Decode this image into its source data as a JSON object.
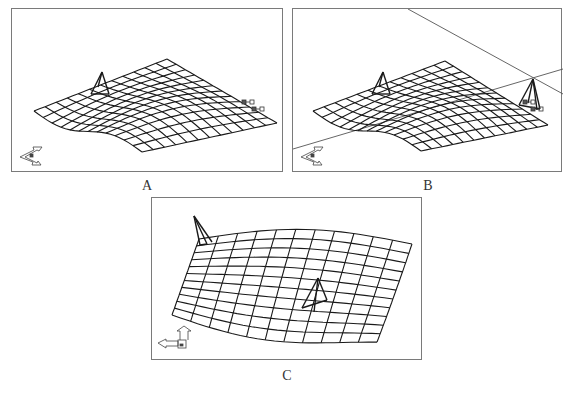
{
  "figure": {
    "panels": [
      {
        "id": "A",
        "caption": "A",
        "description": "Wireframe deformable surface mesh with single pyramid control handle and small selected node markers at right edge"
      },
      {
        "id": "B",
        "caption": "B",
        "description": "Same mesh with construction lines intersecting at a second pyramid handle above right-edge nodes"
      },
      {
        "id": "C",
        "caption": "C",
        "description": "Mesh viewed from another angle, showing pyramid handles at top-left edge and center"
      }
    ],
    "colors": {
      "mesh": "#1a1a1a",
      "frame": "#7a7a7a",
      "construction_line": "#555555",
      "background": "#ffffff"
    },
    "icons": [
      "axis-triad-icon",
      "pyramid-handle-icon",
      "node-marker-icon"
    ]
  }
}
